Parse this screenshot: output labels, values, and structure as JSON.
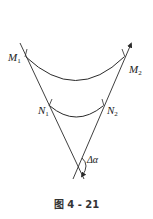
{
  "diagram": {
    "labels": {
      "M1": "M",
      "M1_sub": "1",
      "M2": "M",
      "M2_sub": "2",
      "N1": "N",
      "N1_sub": "1",
      "N2": "N",
      "N2_sub": "2",
      "angle": "Δα"
    },
    "caption": "图 4 - 21",
    "stroke_color": "#2a2a2a"
  }
}
